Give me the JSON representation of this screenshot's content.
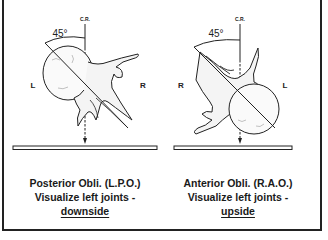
{
  "figure_left": {
    "cr_label": "C.R.",
    "angle_label": "45°",
    "side_left": "L",
    "side_right": "R",
    "caption_line1": "Posterior Obli. (L.P.O.)",
    "caption_line2": "Visualize left joints -",
    "caption_line3": "downside"
  },
  "figure_right": {
    "cr_label": "C.R.",
    "angle_label": "45°",
    "side_left": "R",
    "side_right": "L",
    "caption_line1": "Anterior Obli. (R.A.O.)",
    "caption_line2": "Visualize left joints -",
    "caption_line3": "upside"
  }
}
